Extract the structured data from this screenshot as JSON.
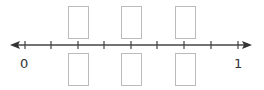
{
  "number_line": {
    "start_label": "0",
    "end_label": "1",
    "tick_count": 9,
    "divisions": 8,
    "line_color": "#444444",
    "box_color": "#bbbbbb"
  },
  "answer_boxes": {
    "top": [
      "",
      "",
      ""
    ],
    "bottom": [
      "",
      "",
      ""
    ]
  }
}
